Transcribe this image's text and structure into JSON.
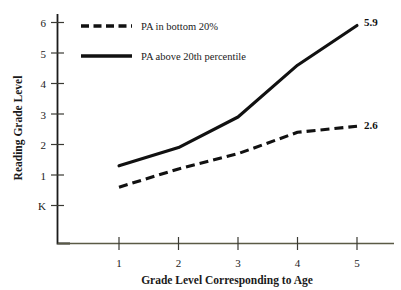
{
  "chart_data": {
    "type": "line",
    "title": "",
    "xlabel": "Grade Level Corresponding to Age",
    "ylabel": "Reading Grade Level",
    "x": [
      1,
      2,
      3,
      4,
      5
    ],
    "xtick_labels": [
      "1",
      "2",
      "3",
      "4",
      "5"
    ],
    "ytick_labels": [
      "K",
      "1",
      "2",
      "3",
      "4",
      "5",
      "6"
    ],
    "ytick_values": [
      0,
      1,
      2,
      3,
      4,
      5,
      6
    ],
    "ylim": [
      0,
      6.4
    ],
    "xlim": [
      0.6,
      5.6
    ],
    "grid": false,
    "legend_position": "top-left",
    "series": [
      {
        "name": "PA in bottom 20%",
        "style": "dashed",
        "color": "#111111",
        "values": [
          0.6,
          1.2,
          1.7,
          2.4,
          2.6
        ],
        "end_label": "2.6"
      },
      {
        "name": "PA above 20th percentile",
        "style": "solid",
        "color": "#111111",
        "values": [
          1.3,
          1.9,
          2.9,
          4.6,
          5.9
        ],
        "end_label": "5.9"
      }
    ],
    "annotations": [
      {
        "text": "5.9",
        "series": "PA above 20th percentile",
        "x": 5
      },
      {
        "text": "2.6",
        "series": "PA in bottom 20%",
        "x": 5
      }
    ]
  },
  "legend": {
    "items": [
      {
        "label": "PA in bottom 20%",
        "style": "dashed"
      },
      {
        "label": "PA above 20th percentile",
        "style": "solid"
      }
    ]
  },
  "axes": {
    "y_title": "Reading Grade Level",
    "x_title": "Grade Level Corresponding to Age",
    "y_ticks": [
      "6",
      "5",
      "4",
      "3",
      "2",
      "1",
      "K"
    ],
    "x_ticks": [
      "1",
      "2",
      "3",
      "4",
      "5"
    ]
  },
  "labels": {
    "solid_end": "5.9",
    "dashed_end": "2.6"
  }
}
